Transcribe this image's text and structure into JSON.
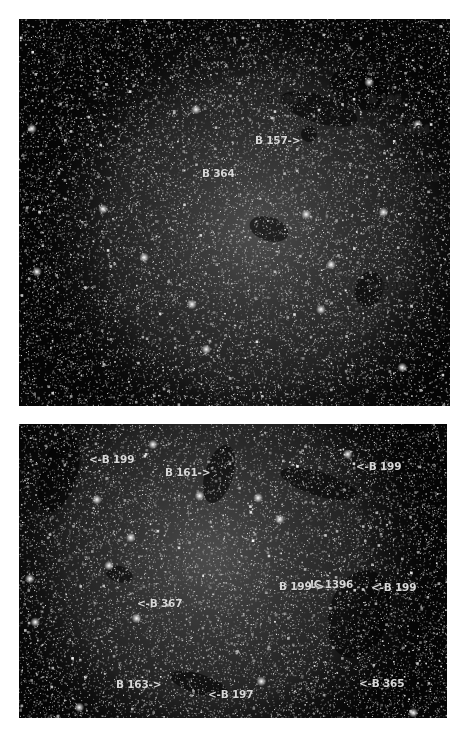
{
  "colors": {
    "page_background": "#ffffff",
    "sky_background": "#050505",
    "nebula_glow": "#7a7a7a",
    "label_light": "#d8d8d8",
    "label_dark": "#1a1a1a"
  },
  "panels": [
    {
      "name": "top-star-field",
      "rect": {
        "x": 19,
        "y": 19,
        "w": 431,
        "h": 387
      },
      "labels": [
        {
          "text": "B 196",
          "x": 247,
          "y": 74,
          "tone": "dark"
        },
        {
          "text": "B 195",
          "x": 350,
          "y": 74,
          "tone": "dark"
        },
        {
          "text": "B 157->",
          "x": 236,
          "y": 115,
          "tone": "light"
        },
        {
          "text": "B 194",
          "x": 378,
          "y": 104,
          "tone": "dark"
        },
        {
          "text": "B 364",
          "x": 183,
          "y": 148,
          "tone": "light"
        },
        {
          "text": "<-B 193",
          "x": 375,
          "y": 152,
          "tone": "dark"
        },
        {
          "text": "<-B 192",
          "x": 350,
          "y": 261,
          "tone": "dark"
        }
      ]
    },
    {
      "name": "bottom-star-field",
      "rect": {
        "x": 19,
        "y": 424,
        "w": 428,
        "h": 294
      },
      "labels": [
        {
          "text": "<-B 199",
          "x": 70,
          "y": 29,
          "tone": "light"
        },
        {
          "text": "B 161->",
          "x": 146,
          "y": 42,
          "tone": "light"
        },
        {
          "text": "<-B 199",
          "x": 337,
          "y": 36,
          "tone": "light"
        },
        {
          "text": "IC 1396",
          "x": 291,
          "y": 154,
          "tone": "light"
        },
        {
          "text": "<-B 367",
          "x": 118,
          "y": 173,
          "tone": "light"
        },
        {
          "text": "B 199->",
          "x": 260,
          "y": 156,
          "tone": "light"
        },
        {
          "text": "<-B 199",
          "x": 352,
          "y": 157,
          "tone": "light"
        },
        {
          "text": "B 163->",
          "x": 97,
          "y": 254,
          "tone": "light"
        },
        {
          "text": "<-B 197",
          "x": 189,
          "y": 264,
          "tone": "light"
        },
        {
          "text": "<-B 365",
          "x": 340,
          "y": 253,
          "tone": "light"
        }
      ]
    }
  ]
}
